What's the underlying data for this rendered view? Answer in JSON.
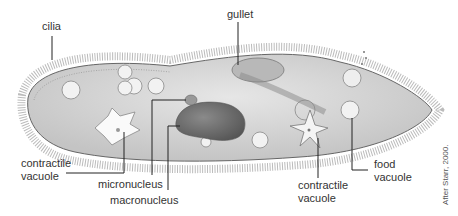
{
  "diagram": {
    "labels": {
      "cilia": "cilia",
      "gullet": "gullet",
      "contractile_vacuole_left_line1": "contractile",
      "contractile_vacuole_left_line2": "vacuole",
      "micronucleus": "micronucleus",
      "macronucleus": "macronucleus",
      "contractile_vacuole_right_line1": "contractile",
      "contractile_vacuole_right_line2": "vacuole",
      "food_vacuole_line1": "food",
      "food_vacuole_line2": "vacuole"
    },
    "credit": "After Starr, 2000."
  }
}
